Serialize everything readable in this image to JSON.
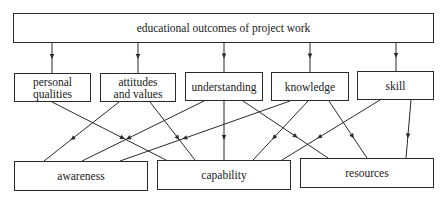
{
  "diagram": {
    "root": {
      "id": "root",
      "label": "educational outcomes of project work",
      "x": 13,
      "y": 13,
      "w": 421,
      "h": 30
    },
    "middle": [
      {
        "id": "personal",
        "label_lines": [
          "personal",
          "qualities"
        ],
        "x": 14,
        "y": 73,
        "w": 77,
        "h": 29
      },
      {
        "id": "attitudes",
        "label_lines": [
          "attitudes",
          "and values"
        ],
        "x": 100,
        "y": 73,
        "w": 76,
        "h": 29
      },
      {
        "id": "understanding",
        "label_lines": [
          "understanding"
        ],
        "x": 185,
        "y": 72,
        "w": 78,
        "h": 29
      },
      {
        "id": "knowledge",
        "label_lines": [
          "knowledge"
        ],
        "x": 271,
        "y": 72,
        "w": 78,
        "h": 29
      },
      {
        "id": "skill",
        "label_lines": [
          "skill"
        ],
        "x": 357,
        "y": 71,
        "w": 77,
        "h": 29
      }
    ],
    "bottom": [
      {
        "id": "awareness",
        "label": "awareness",
        "x": 14,
        "y": 161,
        "w": 134,
        "h": 30
      },
      {
        "id": "capability",
        "label": "capability",
        "x": 157,
        "y": 160,
        "w": 134,
        "h": 30
      },
      {
        "id": "resources",
        "label": "resources",
        "x": 300,
        "y": 158,
        "w": 134,
        "h": 30
      }
    ],
    "edges": [
      {
        "from": "root",
        "to": "personal",
        "x1": 52,
        "y1": 43,
        "x2": 52,
        "y2": 73
      },
      {
        "from": "root",
        "to": "attitudes",
        "x1": 138,
        "y1": 43,
        "x2": 138,
        "y2": 73
      },
      {
        "from": "root",
        "to": "understanding",
        "x1": 224,
        "y1": 43,
        "x2": 224,
        "y2": 72
      },
      {
        "from": "root",
        "to": "knowledge",
        "x1": 310,
        "y1": 43,
        "x2": 310,
        "y2": 72
      },
      {
        "from": "root",
        "to": "skill",
        "x1": 396,
        "y1": 43,
        "x2": 396,
        "y2": 71
      },
      {
        "from": "personal",
        "to": "capability",
        "x1": 52,
        "y1": 102,
        "x2": 166,
        "y2": 160
      },
      {
        "from": "attitudes",
        "to": "awareness",
        "x1": 119,
        "y1": 102,
        "x2": 44,
        "y2": 161
      },
      {
        "from": "attitudes",
        "to": "capability",
        "x1": 150,
        "y1": 102,
        "x2": 195,
        "y2": 160
      },
      {
        "from": "understanding",
        "to": "awareness",
        "x1": 204,
        "y1": 101,
        "x2": 82,
        "y2": 161
      },
      {
        "from": "understanding",
        "to": "capability",
        "x1": 224,
        "y1": 101,
        "x2": 224,
        "y2": 160
      },
      {
        "from": "understanding",
        "to": "resources",
        "x1": 243,
        "y1": 101,
        "x2": 328,
        "y2": 158
      },
      {
        "from": "knowledge",
        "to": "awareness",
        "x1": 290,
        "y1": 101,
        "x2": 120,
        "y2": 161
      },
      {
        "from": "knowledge",
        "to": "capability",
        "x1": 308,
        "y1": 101,
        "x2": 253,
        "y2": 160
      },
      {
        "from": "knowledge",
        "to": "resources",
        "x1": 329,
        "y1": 101,
        "x2": 367,
        "y2": 158
      },
      {
        "from": "skill",
        "to": "capability",
        "x1": 380,
        "y1": 100,
        "x2": 282,
        "y2": 160
      },
      {
        "from": "skill",
        "to": "resources",
        "x1": 411,
        "y1": 100,
        "x2": 406,
        "y2": 158
      }
    ],
    "colors": {
      "line": "#2a2a2a",
      "box_border": "#2a2a2a",
      "background": "#ffffff"
    }
  }
}
